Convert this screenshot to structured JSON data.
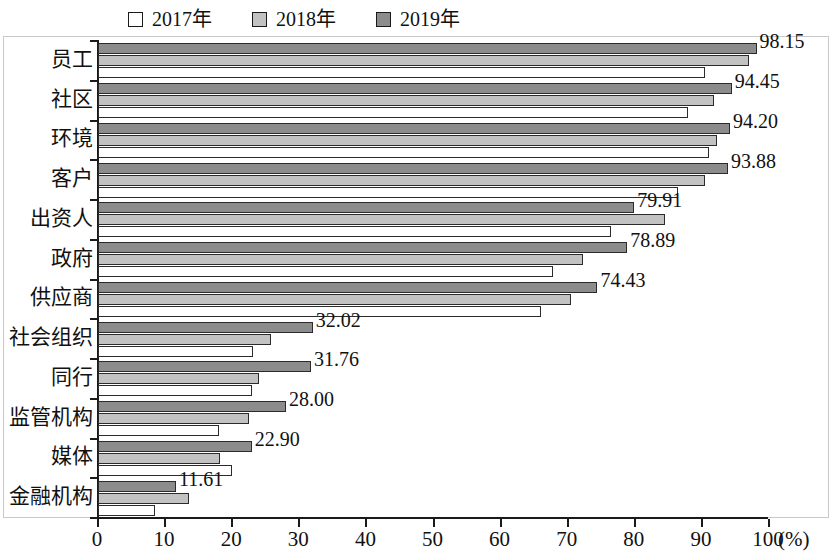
{
  "chart_data": {
    "type": "bar",
    "orientation": "horizontal",
    "title": "",
    "xlabel": "(%)",
    "ylabel": "",
    "xlim": [
      0,
      100
    ],
    "xticks": [
      "0",
      "10",
      "20",
      "30",
      "40",
      "50",
      "60",
      "70",
      "80",
      "90",
      "100"
    ],
    "unit": "(%)",
    "grid": false,
    "legend_position": "top",
    "categories": [
      "员工",
      "社区",
      "环境",
      "客户",
      "出资人",
      "政府",
      "供应商",
      "社会组织",
      "同行",
      "监管机构",
      "媒体",
      "金融机构"
    ],
    "series": [
      {
        "name": "2019年",
        "color": "#8c8c8c",
        "values": [
          98.15,
          94.45,
          94.2,
          93.88,
          79.91,
          78.89,
          74.43,
          32.02,
          31.76,
          28.0,
          22.9,
          11.61
        ],
        "labels": [
          "98.15",
          "94.45",
          "94.20",
          "93.88",
          "79.91",
          "78.89",
          "74.43",
          "32.02",
          "31.76",
          "28.00",
          "22.90",
          "11.61"
        ]
      },
      {
        "name": "2018年",
        "color": "#c2c2c2",
        "values": [
          97.0,
          91.8,
          92.2,
          90.4,
          84.5,
          72.3,
          70.5,
          25.8,
          24.0,
          22.5,
          18.2,
          13.5
        ]
      },
      {
        "name": "2017年",
        "color": "#ffffff",
        "values": [
          90.5,
          88.0,
          91.0,
          86.4,
          76.5,
          67.8,
          66.0,
          23.1,
          23.0,
          18.0,
          20.0,
          8.5
        ]
      }
    ]
  },
  "legend": {
    "items": [
      {
        "label": "2017年",
        "swatch": "#ffffff"
      },
      {
        "label": "2018年",
        "swatch": "#c2c2c2"
      },
      {
        "label": "2019年",
        "swatch": "#8c8c8c"
      }
    ]
  },
  "axis": {
    "unit_label": "(%)"
  }
}
